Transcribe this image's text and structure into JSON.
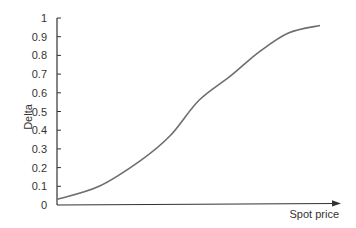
{
  "chart_data": {
    "type": "line",
    "title": "",
    "xlabel": "Spot price",
    "ylabel": "Delta",
    "ylim": [
      0,
      1
    ],
    "yticks": [
      "0",
      "0.1",
      "0.2",
      "0.3",
      "0.4",
      "0.5",
      "0.6",
      "0.7",
      "0.8",
      "0.9",
      "1"
    ],
    "xticks": [],
    "grid": false,
    "legend": null,
    "x_axis_arrow": true,
    "series": [
      {
        "name": "Delta",
        "color": "#6e6e6e",
        "x": [
          0,
          0.16,
          0.32,
          0.43,
          0.54,
          0.66,
          0.77,
          0.88,
          1.0
        ],
        "values": [
          0.03,
          0.1,
          0.24,
          0.37,
          0.56,
          0.69,
          0.82,
          0.92,
          0.96
        ]
      }
    ]
  },
  "colors": {
    "axis": "#333333",
    "curve": "#6e6e6e",
    "text": "#333333"
  }
}
